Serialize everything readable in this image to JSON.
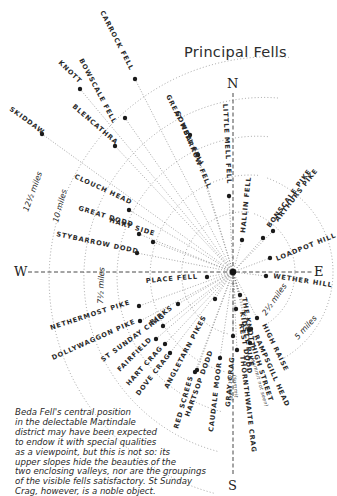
{
  "title": "Principal Fells",
  "compass": {
    "north": "N",
    "south": "S",
    "east": "E",
    "west": "W"
  },
  "center": {
    "x": 233,
    "y": 272
  },
  "rings": [
    {
      "label": "2½ miles",
      "radius": 62
    },
    {
      "label": "5 miles",
      "radius": 100
    },
    {
      "label": "7½ miles",
      "radius": 140
    },
    {
      "label": "10 miles",
      "radius": 180
    },
    {
      "label": "12½ miles",
      "radius": 222
    }
  ],
  "fells": [
    {
      "name": "CARROCK FELL",
      "x": 135,
      "y": 79
    },
    {
      "name": "BOWSCALE FELL",
      "x": 125,
      "y": 118
    },
    {
      "name": "KNOTT",
      "x": 80,
      "y": 89
    },
    {
      "name": "BLENCATHRA",
      "x": 115,
      "y": 146
    },
    {
      "name": "SKIDDAW",
      "x": 42,
      "y": 134
    },
    {
      "name": "GREAT MELL FELL",
      "x": 190,
      "y": 135
    },
    {
      "name": "GOWBARROW FELL",
      "x": 198,
      "y": 155
    },
    {
      "name": "LITTLE MELL FELL",
      "x": 229,
      "y": 196
    },
    {
      "name": "HALLIN FELL",
      "x": 242,
      "y": 240
    },
    {
      "name": "CLOUCH HEAD",
      "x": 129,
      "y": 210
    },
    {
      "name": "GREAT DODD",
      "x": 139,
      "y": 234
    },
    {
      "name": "HART SIDE",
      "x": 153,
      "y": 242
    },
    {
      "name": "STYBARROW DODD",
      "x": 137,
      "y": 253
    },
    {
      "name": "BONSCALE PIKE",
      "x": 263,
      "y": 238
    },
    {
      "name": "ARTHURS PIKE",
      "x": 273,
      "y": 231
    },
    {
      "name": "LOADPOT HILL",
      "x": 270,
      "y": 258
    },
    {
      "name": "WETHER HILL",
      "x": 266,
      "y": 276
    },
    {
      "name": "PLACE FELL",
      "x": 207,
      "y": 277
    },
    {
      "name": "NETHERMOST PIKE",
      "x": 139,
      "y": 306
    },
    {
      "name": "DOLLYWAGGON PIKE",
      "x": 140,
      "y": 321
    },
    {
      "name": "BIRKS",
      "x": 163,
      "y": 326
    },
    {
      "name": "ST SUNDAY CRAG",
      "x": 178,
      "y": 304
    },
    {
      "name": "FAIRFIELD",
      "x": 156,
      "y": 339
    },
    {
      "name": "HART CRAG",
      "x": 165,
      "y": 344
    },
    {
      "name": "DOVE CRAG",
      "x": 170,
      "y": 353
    },
    {
      "name": "ANGLETARN PIKES",
      "x": 215,
      "y": 299
    },
    {
      "name": "HARTSOP DODD",
      "x": 197,
      "y": 370
    },
    {
      "name": "RED SCREES",
      "x": 195,
      "y": 372
    },
    {
      "name": "CAUDALE MOOR",
      "x": 220,
      "y": 358
    },
    {
      "name": "GRAY CRAG",
      "x": 233,
      "y": 336
    },
    {
      "name": "THE KNOTT",
      "x": 240,
      "y": 295
    },
    {
      "name": "REST DODD",
      "x": 236,
      "y": 309
    },
    {
      "name": "KIDSTY PIKE",
      "x": 251,
      "y": 329
    },
    {
      "name": "HIGH RAISE",
      "x": 257,
      "y": 318
    },
    {
      "name": "RAMPSGILL HEAD",
      "x": 249,
      "y": 330
    },
    {
      "name": "HIGH STREET",
      "x": 250,
      "y": 343
    },
    {
      "name": "THORNTHWAITE CRAG",
      "x": 237,
      "y": 350
    }
  ],
  "labels": [
    {
      "text": "CARROCK FELL",
      "x": 100,
      "y": 12,
      "rot": 63
    },
    {
      "text": "BOWSCALE FELL",
      "x": 79,
      "y": 60,
      "rot": 62
    },
    {
      "text": "KNOTT",
      "x": 58,
      "y": 63,
      "rot": 44
    },
    {
      "text": "BLENCATHRA",
      "x": 72,
      "y": 107,
      "rot": 41
    },
    {
      "text": "SKIDDAW",
      "x": 9,
      "y": 110,
      "rot": 36
    },
    {
      "text": "GREAT MELL FELL",
      "x": 166,
      "y": 96,
      "rot": 64
    },
    {
      "text": "GOWBARROW FELL",
      "x": 175,
      "y": 112,
      "rot": 67
    },
    {
      "text": "LITTLE MELL FELL",
      "x": 223,
      "y": 104,
      "rot": 87
    },
    {
      "text": "HALLIN FELL",
      "x": 245,
      "y": 233,
      "rot": -84
    },
    {
      "text": "CLOUCH HEAD",
      "x": 74,
      "y": 178,
      "rot": 25
    },
    {
      "text": "GREAT DODD",
      "x": 78,
      "y": 210,
      "rot": 17
    },
    {
      "text": "HART SIDE",
      "x": 109,
      "y": 222,
      "rot": 17
    },
    {
      "text": "STYBARROW DODD",
      "x": 56,
      "y": 236,
      "rot": 12
    },
    {
      "text": "BONSCALE PIKE",
      "x": 270,
      "y": 228,
      "rot": -54
    },
    {
      "text": "ARTHURS PIKE",
      "x": 278,
      "y": 222,
      "rot": -52
    },
    {
      "text": "LOADPOT HILL",
      "x": 277,
      "y": 261,
      "rot": -22
    },
    {
      "text": "WETHER HILL",
      "x": 273,
      "y": 278,
      "rot": 9
    },
    {
      "text": "PLACE FELL",
      "x": 146,
      "y": 283,
      "rot": -5
    },
    {
      "text": "NETHERMOST PIKE",
      "x": 51,
      "y": 330,
      "rot": -18
    },
    {
      "text": "DOLLYWAGGON PIKE",
      "x": 53,
      "y": 360,
      "rot": -24
    },
    {
      "text": "ST SUNDAY CRAG",
      "x": 103,
      "y": 362,
      "rot": -36
    },
    {
      "text": "BIRKS",
      "x": 152,
      "y": 325,
      "rot": -38
    },
    {
      "text": "FAIRFIELD",
      "x": 120,
      "y": 372,
      "rot": -45
    },
    {
      "text": "HART CRAG",
      "x": 129,
      "y": 386,
      "rot": -48
    },
    {
      "text": "DOVE CRAG",
      "x": 139,
      "y": 396,
      "rot": -52
    },
    {
      "text": "ANGLETARN PIKES",
      "x": 168,
      "y": 389,
      "rot": -62
    },
    {
      "text": "HARTSOP DODD",
      "x": 189,
      "y": 417,
      "rot": -70
    },
    {
      "text": "RED SCREES",
      "x": 178,
      "y": 429,
      "rot": -74
    },
    {
      "text": "CAUDALE MOOR",
      "x": 213,
      "y": 432,
      "rot": -83
    },
    {
      "text": "GRAY CRAG",
      "x": 230,
      "y": 407,
      "rot": -85
    },
    {
      "text": "THE KNOTT",
      "x": 242,
      "y": 298,
      "rot": 80
    },
    {
      "text": "REST DODD",
      "x": 239,
      "y": 324,
      "rot": 80
    },
    {
      "text": "KIDSTY PIKE",
      "x": 240,
      "y": 312,
      "rot": 80
    },
    {
      "text": "HIGH RAISE",
      "x": 262,
      "y": 325,
      "rot": 64
    },
    {
      "text": "RAMPSGILL HEAD",
      "x": 254,
      "y": 336,
      "rot": 66
    },
    {
      "text": "HIGH STREET",
      "x": 251,
      "y": 346,
      "rot": 72
    },
    {
      "text": "THORNTHWAITE CRAG",
      "x": 240,
      "y": 356,
      "rot": 83
    }
  ],
  "sublabels": [
    {
      "text": "(summit not seen)",
      "x": 251,
      "y": 358,
      "rot": 74
    },
    {
      "text": "(summit",
      "x": 233,
      "y": 375,
      "rot": 86
    },
    {
      "text": "not seen)",
      "x": 228,
      "y": 375,
      "rot": 86
    }
  ],
  "ring_labels": [
    {
      "text": "12½ miles",
      "x": 28,
      "y": 212,
      "rot": -70
    },
    {
      "text": "10 miles",
      "x": 58,
      "y": 223,
      "rot": -75
    },
    {
      "text": "7½ miles",
      "x": 103,
      "y": 304,
      "rot": -88
    },
    {
      "text": "2½ miles",
      "x": 266,
      "y": 316,
      "rot": -55
    },
    {
      "text": "5 miles",
      "x": 298,
      "y": 340,
      "rot": -48
    }
  ],
  "note": {
    "lines": [
      "Beda Fell's central position",
      "in the delectable Martindale",
      "district may have been expected",
      "to endow it with special qualities",
      "as a viewpoint, but this is not so: its",
      "upper slopes hide the beauties of the",
      "two enclosing valleys, nor are the groupings",
      "of the visible fells satisfactory.   St Sunday",
      "Crag, however, is a noble object."
    ]
  },
  "colors": {
    "ink": "#2a2a2a",
    "line": "#6a6a6a",
    "background": "#ffffff"
  }
}
